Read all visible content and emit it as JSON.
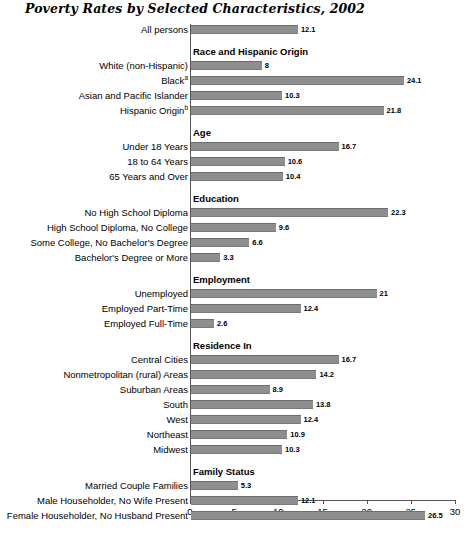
{
  "chart_data": {
    "type": "bar",
    "orientation": "horizontal",
    "title": "Poverty Rates by Selected Characteristics, 2002",
    "xlabel": "",
    "ylabel": "",
    "xlim": [
      0,
      30
    ],
    "xticks": [
      0,
      5,
      10,
      15,
      20,
      25,
      30
    ],
    "xtick_labels": [
      "0",
      "5",
      "10",
      "15",
      "20",
      "25",
      "30"
    ],
    "grid": false,
    "legend": "none",
    "bar_color": "#8e8e8e",
    "categories": [
      "All persons",
      "White (non-Hispanic)",
      "Black",
      "Asian and Pacific Islander",
      "Hispanic Origin",
      "Under 18 Years",
      "18 to 64 Years",
      "65 Years and Over",
      "No High School Diploma",
      "High School Diploma, No College",
      "Some College, No Bachelor's Degree",
      "Bachelor's Degree or More",
      "Unemployed",
      "Employed Part-Time",
      "Employed Full-Time",
      "Central Cities",
      "Nonmetropolitan (rural) Areas",
      "Suburban Areas",
      "South",
      "West",
      "Northeast",
      "Midwest",
      "Married Couple Families",
      "Male Householder, No Wife Present",
      "Female Householder, No Husband Present"
    ],
    "values": [
      12.1,
      8,
      24.1,
      10.3,
      21.8,
      16.7,
      10.6,
      10.4,
      22.3,
      9.6,
      6.6,
      3.3,
      21,
      12.4,
      2.6,
      16.7,
      14.2,
      8.9,
      13.8,
      12.4,
      10.9,
      10.3,
      5.3,
      12.1,
      26.5
    ],
    "group_headers": [
      "Race and Hispanic Origin",
      "Age",
      "Education",
      "Employment",
      "Residence In",
      "Family Status"
    ]
  },
  "sections": [
    {
      "header": "",
      "rows": [
        {
          "label": "All persons",
          "sup": "",
          "value": 12.1,
          "value_label": "12.1"
        }
      ]
    },
    {
      "header": "Race and Hispanic Origin",
      "rows": [
        {
          "label": "White (non-Hispanic)",
          "sup": "",
          "value": 8,
          "value_label": "8"
        },
        {
          "label": "Black",
          "sup": "a",
          "value": 24.1,
          "value_label": "24.1"
        },
        {
          "label": "Asian and Pacific Islander",
          "sup": "",
          "value": 10.3,
          "value_label": "10.3"
        },
        {
          "label": "Hispanic Origin",
          "sup": "b",
          "value": 21.8,
          "value_label": "21.8"
        }
      ]
    },
    {
      "header": "Age",
      "rows": [
        {
          "label": "Under 18 Years",
          "sup": "",
          "value": 16.7,
          "value_label": "16.7"
        },
        {
          "label": "18 to 64 Years",
          "sup": "",
          "value": 10.6,
          "value_label": "10.6"
        },
        {
          "label": "65 Years and Over",
          "sup": "",
          "value": 10.4,
          "value_label": "10.4"
        }
      ]
    },
    {
      "header": "Education",
      "rows": [
        {
          "label": "No High School Diploma",
          "sup": "",
          "value": 22.3,
          "value_label": "22.3"
        },
        {
          "label": "High School Diploma, No College",
          "sup": "",
          "value": 9.6,
          "value_label": "9.6"
        },
        {
          "label": "Some College, No Bachelor's Degree",
          "sup": "",
          "value": 6.6,
          "value_label": "6.6"
        },
        {
          "label": "Bachelor's Degree or More",
          "sup": "",
          "value": 3.3,
          "value_label": "3.3"
        }
      ]
    },
    {
      "header": "Employment",
      "rows": [
        {
          "label": "Unemployed",
          "sup": "",
          "value": 21,
          "value_label": "21"
        },
        {
          "label": "Employed Part-Time",
          "sup": "",
          "value": 12.4,
          "value_label": "12.4"
        },
        {
          "label": "Employed Full-Time",
          "sup": "",
          "value": 2.6,
          "value_label": "2.6"
        }
      ]
    },
    {
      "header": "Residence In",
      "rows": [
        {
          "label": "Central Cities",
          "sup": "",
          "value": 16.7,
          "value_label": "16.7"
        },
        {
          "label": "Nonmetropolitan (rural) Areas",
          "sup": "",
          "value": 14.2,
          "value_label": "14.2"
        },
        {
          "label": "Suburban Areas",
          "sup": "",
          "value": 8.9,
          "value_label": "8.9"
        },
        {
          "label": "South",
          "sup": "",
          "value": 13.8,
          "value_label": "13.8"
        },
        {
          "label": "West",
          "sup": "",
          "value": 12.4,
          "value_label": "12.4"
        },
        {
          "label": "Northeast",
          "sup": "",
          "value": 10.9,
          "value_label": "10.9"
        },
        {
          "label": "Midwest",
          "sup": "",
          "value": 10.3,
          "value_label": "10.3"
        }
      ]
    },
    {
      "header": "Family Status",
      "rows": [
        {
          "label": "Married Couple Families",
          "sup": "",
          "value": 5.3,
          "value_label": "5.3"
        },
        {
          "label": "Male Householder, No Wife Present",
          "sup": "",
          "value": 12.1,
          "value_label": "12.1"
        },
        {
          "label": "Female Householder, No Husband Present",
          "sup": "",
          "value": 26.5,
          "value_label": "26.5"
        }
      ]
    }
  ],
  "axis": {
    "ticks": [
      "0",
      "5",
      "10",
      "15",
      "20",
      "25",
      "30"
    ]
  }
}
